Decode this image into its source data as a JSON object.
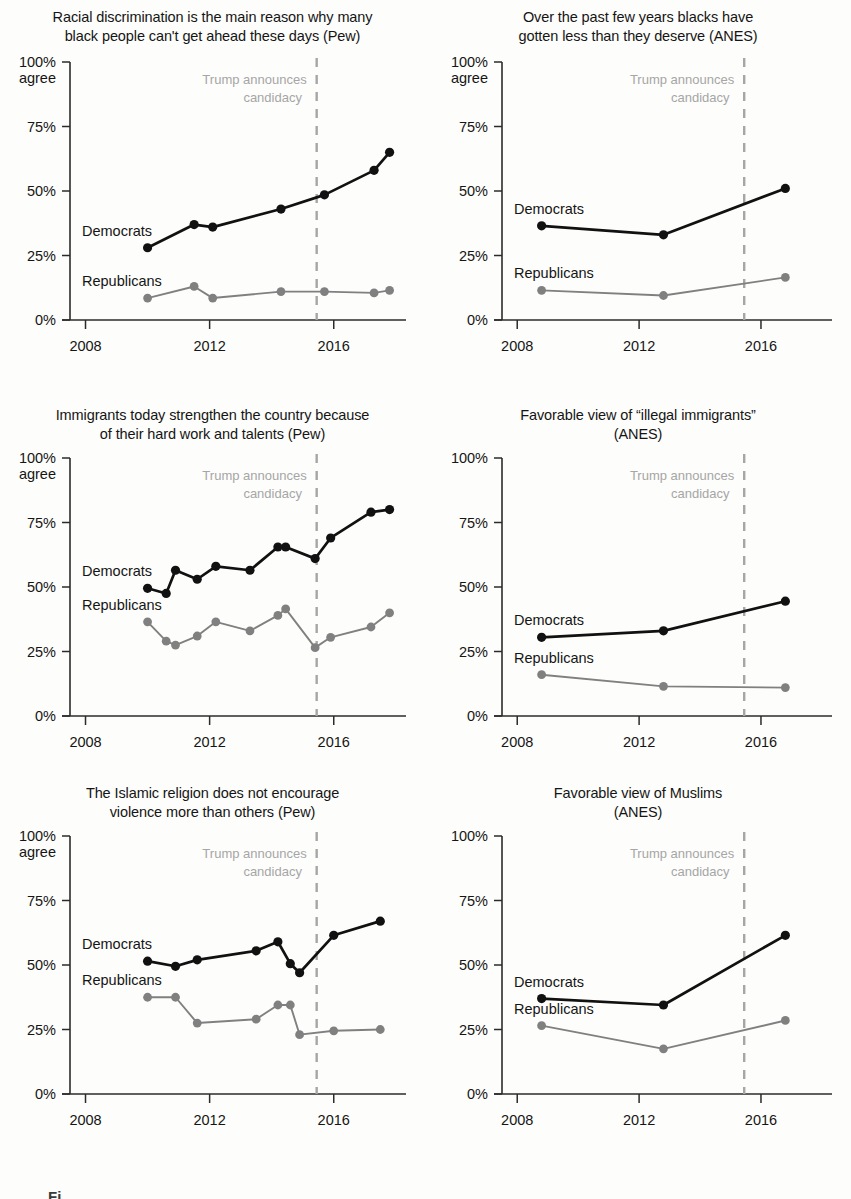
{
  "figure": {
    "caption_stub": "Fi",
    "series_colors": {
      "democrats": "#111111",
      "republicans": "#808080"
    },
    "annotation_color": "#a6a6a6",
    "background": "#fdfdfb"
  },
  "common": {
    "y_axis_caption_line1": "100%",
    "y_axis_caption_line2": "agree",
    "y_ticks": [
      "100%",
      "75%",
      "50%",
      "25%",
      "0%"
    ],
    "y_tick_values": [
      100,
      75,
      50,
      25,
      0
    ],
    "x_ticks": [
      "2008",
      "2012",
      "2016"
    ],
    "x_tick_values": [
      2008,
      2012,
      2016
    ],
    "annotation_line1": "Trump announces",
    "annotation_line2": "candidacy",
    "annotation_year": 2015.45,
    "label_democrats": "Democrats",
    "label_republicans": "Republicans"
  },
  "chart_data": [
    {
      "id": "racial-discrimination",
      "type": "line",
      "title": "Racial discrimination is the main reason why many black people can't get ahead these days (Pew)",
      "title_line1": "Racial discrimination is the main reason why many",
      "title_line2": "black people can't get ahead these days (Pew)",
      "source": "Pew",
      "ylabel": "100% agree",
      "xlabel": "",
      "ylim": [
        0,
        100
      ],
      "xlim": [
        2007.5,
        2018.2
      ],
      "grid": false,
      "legend_position": "inline-left",
      "annotation": "Trump announces candidacy",
      "series": [
        {
          "name": "Democrats",
          "x": [
            2010.0,
            2011.5,
            2012.1,
            2014.3,
            2015.7,
            2017.3,
            2017.8
          ],
          "values": [
            28,
            37,
            36,
            43,
            48.5,
            58,
            65
          ]
        },
        {
          "name": "Republicans",
          "x": [
            2010.0,
            2011.5,
            2012.1,
            2014.3,
            2015.7,
            2017.3,
            2017.8
          ],
          "values": [
            8.5,
            13,
            8.5,
            11,
            11,
            10.5,
            11.5
          ]
        }
      ]
    },
    {
      "id": "blacks-less-than-deserve",
      "type": "line",
      "title": "Over the past few years blacks have gotten less than they deserve (ANES)",
      "title_line1": "Over the past few years blacks have",
      "title_line2": "gotten less than they deserve (ANES)",
      "source": "ANES",
      "ylabel": "100% agree",
      "xlabel": "",
      "ylim": [
        0,
        100
      ],
      "xlim": [
        2007.5,
        2018.2
      ],
      "grid": false,
      "legend_position": "inline-left",
      "annotation": "Trump announces candidacy",
      "series": [
        {
          "name": "Democrats",
          "x": [
            2008.8,
            2012.8,
            2016.8
          ],
          "values": [
            36.5,
            33,
            51
          ]
        },
        {
          "name": "Republicans",
          "x": [
            2008.8,
            2012.8,
            2016.8
          ],
          "values": [
            11.5,
            9.5,
            16.5
          ]
        }
      ]
    },
    {
      "id": "immigrants-strengthen",
      "type": "line",
      "title": "Immigrants today strengthen the country because of their hard work and talents (Pew)",
      "title_line1": "Immigrants today strengthen the country because",
      "title_line2": "of their hard work and talents (Pew)",
      "source": "Pew",
      "ylabel": "100% agree",
      "xlabel": "",
      "ylim": [
        0,
        100
      ],
      "xlim": [
        2007.5,
        2018.2
      ],
      "grid": false,
      "legend_position": "inline-left",
      "annotation": "Trump announces candidacy",
      "series": [
        {
          "name": "Democrats",
          "x": [
            2010.0,
            2010.6,
            2010.9,
            2011.6,
            2012.2,
            2013.3,
            2014.2,
            2014.45,
            2015.4,
            2015.9,
            2017.2,
            2017.8
          ],
          "values": [
            49.5,
            47.5,
            56.5,
            53,
            58,
            56.5,
            65.5,
            65.5,
            61,
            69,
            79,
            80
          ]
        },
        {
          "name": "Republicans",
          "x": [
            2010.0,
            2010.6,
            2010.9,
            2011.6,
            2012.2,
            2013.3,
            2014.2,
            2014.45,
            2015.4,
            2015.9,
            2017.2,
            2017.8
          ],
          "values": [
            36.5,
            29,
            27.5,
            31,
            36.5,
            33,
            39,
            41.5,
            26.5,
            30.5,
            34.5,
            40
          ]
        }
      ]
    },
    {
      "id": "favorable-illegal-immigrants",
      "type": "line",
      "title": "Favorable view of “illegal immigrants” (ANES)",
      "title_line1": "Favorable view of “illegal immigrants”",
      "title_line2": "(ANES)",
      "source": "ANES",
      "ylabel": "",
      "xlabel": "",
      "ylim": [
        0,
        100
      ],
      "xlim": [
        2007.5,
        2018.2
      ],
      "grid": false,
      "legend_position": "inline-left",
      "annotation": "Trump announces candidacy",
      "series": [
        {
          "name": "Democrats",
          "x": [
            2008.8,
            2012.8,
            2016.8
          ],
          "values": [
            30.5,
            33,
            44.5
          ]
        },
        {
          "name": "Republicans",
          "x": [
            2008.8,
            2012.8,
            2016.8
          ],
          "values": [
            16,
            11.5,
            11
          ]
        }
      ]
    },
    {
      "id": "islamic-religion",
      "type": "line",
      "title": "The Islamic religion does not encourage violence more than others (Pew)",
      "title_line1": "The Islamic religion does not encourage",
      "title_line2": "violence more than others (Pew)",
      "source": "Pew",
      "ylabel": "100% agree",
      "xlabel": "",
      "ylim": [
        0,
        100
      ],
      "xlim": [
        2007.5,
        2018.2
      ],
      "grid": false,
      "legend_position": "inline-left",
      "annotation": "Trump announces candidacy",
      "series": [
        {
          "name": "Democrats",
          "x": [
            2010.0,
            2010.9,
            2011.6,
            2013.5,
            2014.2,
            2014.6,
            2014.9,
            2016.0,
            2017.5
          ],
          "values": [
            51.5,
            49.5,
            52,
            55.5,
            59,
            50.5,
            47,
            61.5,
            67
          ]
        },
        {
          "name": "Republicans",
          "x": [
            2010.0,
            2010.9,
            2011.6,
            2013.5,
            2014.2,
            2014.6,
            2014.9,
            2016.0,
            2017.5
          ],
          "values": [
            37.5,
            37.5,
            27.5,
            29,
            34.5,
            34.5,
            23,
            24.5,
            25
          ]
        }
      ]
    },
    {
      "id": "favorable-muslims",
      "type": "line",
      "title": "Favorable view of Muslims (ANES)",
      "title_line1": "Favorable view of Muslims",
      "title_line2": "(ANES)",
      "source": "ANES",
      "ylabel": "",
      "xlabel": "",
      "ylim": [
        0,
        100
      ],
      "xlim": [
        2007.5,
        2018.2
      ],
      "grid": false,
      "legend_position": "inline-left",
      "annotation": "Trump announces candidacy",
      "series": [
        {
          "name": "Democrats",
          "x": [
            2008.8,
            2012.8,
            2016.8
          ],
          "values": [
            37,
            34.5,
            61.5
          ]
        },
        {
          "name": "Republicans",
          "x": [
            2008.8,
            2012.8,
            2016.8
          ],
          "values": [
            26.5,
            17.5,
            28.5
          ]
        }
      ]
    }
  ]
}
